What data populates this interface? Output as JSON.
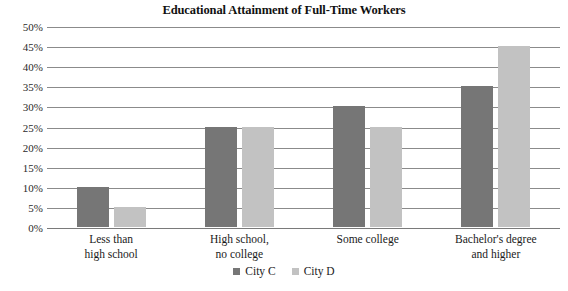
{
  "chart_data": {
    "type": "bar",
    "title": "Educational Attainment of Full-Time Workers",
    "xlabel": "",
    "ylabel": "",
    "categories": [
      "Less than high school",
      "High school, no college",
      "Some college",
      "Bachelor's degree and higher"
    ],
    "category_lines": [
      [
        "Less than",
        "high school"
      ],
      [
        "High school,",
        "no college"
      ],
      [
        "Some college"
      ],
      [
        "Bachelor's degree",
        "and higher"
      ]
    ],
    "series": [
      {
        "name": "City C",
        "color": "#767676",
        "values": [
          10,
          25,
          30,
          35
        ]
      },
      {
        "name": "City D",
        "color": "#c2c2c2",
        "values": [
          5,
          25,
          25,
          45
        ]
      }
    ],
    "ylim": [
      0,
      50
    ],
    "ytick_step": 5,
    "ytick_labels": [
      "50%",
      "45%",
      "40%",
      "35%",
      "30%",
      "25%",
      "20%",
      "15%",
      "10%",
      "5%",
      "0%"
    ],
    "ytick_values": [
      50,
      45,
      40,
      35,
      30,
      25,
      20,
      15,
      10,
      5,
      0
    ],
    "grid": true,
    "grid_color": "#8b8b8b",
    "legend_position": "bottom",
    "value_unit": "%"
  }
}
